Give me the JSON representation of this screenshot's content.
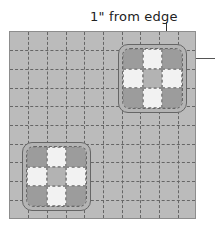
{
  "annotation": {
    "label": "1\" from edge",
    "arrows": [
      "down-arrow",
      "left-arrow"
    ]
  },
  "quilt": {
    "grid_columns": 10,
    "grid_rows": 10,
    "colors": {
      "background": "#bbbbbb",
      "dark": "#9c9c9c",
      "light": "#f2f2f2",
      "mid": "#b3b3b3",
      "stitch": "#666666"
    },
    "blocks": [
      {
        "name": "top-right-block",
        "pattern": [
          "dark",
          "light",
          "dark",
          "light",
          "mid",
          "light",
          "dark",
          "light",
          "dark"
        ]
      },
      {
        "name": "bottom-left-block",
        "pattern": [
          "dark",
          "light",
          "dark",
          "light",
          "mid",
          "light",
          "dark",
          "light",
          "dark"
        ]
      }
    ]
  }
}
